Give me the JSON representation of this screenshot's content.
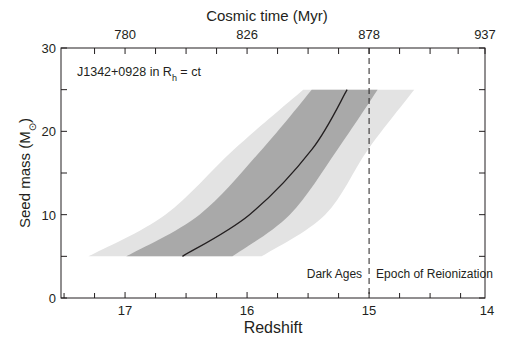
{
  "chart_data": {
    "type": "area",
    "title": "",
    "annotation": {
      "object": "J1342+0928 in R",
      "subscript": "h",
      "suffix": " = ct"
    },
    "xlabel": "Redshift",
    "ylabel": "Seed mass (M",
    "ylabel_sub": "⊙",
    "ylabel_end": ")",
    "x2label": "Cosmic time (Myr)",
    "xlim": [
      17.525,
      14.05
    ],
    "ylim": [
      0,
      30
    ],
    "grid": false,
    "x_ticks": [
      17,
      16,
      15,
      14
    ],
    "x_minor_step": 0.25,
    "y_ticks": [
      0,
      10,
      20,
      30
    ],
    "y_minor_step": 5,
    "x2_ticks": [
      {
        "label": "780",
        "z": 17
      },
      {
        "label": "826",
        "z": 16
      },
      {
        "label": "878",
        "z": 15
      },
      {
        "label": "937",
        "z": 14.05
      }
    ],
    "x2_minor": [
      17.25,
      16.75,
      16.5,
      16.25,
      15.75,
      15.5,
      15.25,
      14.75,
      14.5,
      14.27
    ],
    "reference_line": {
      "z": 15,
      "style": "dashed"
    },
    "region_labels": {
      "left": "Dark Ages",
      "right": "Epoch of Reionization"
    },
    "series": [
      {
        "name": "outer band",
        "color": "#e3e3e3",
        "lower_edge": [
          [
            17.3,
            5
          ],
          [
            16.67,
            10
          ],
          [
            16.11,
            17.8
          ],
          [
            15.54,
            25
          ]
        ],
        "upper_edge": [
          [
            15.88,
            5
          ],
          [
            15.36,
            10
          ],
          [
            15.01,
            17.8
          ],
          [
            14.63,
            25
          ]
        ]
      },
      {
        "name": "inner band",
        "color": "#a9a9a9",
        "lower_edge": [
          [
            16.99,
            5
          ],
          [
            16.39,
            10
          ],
          [
            15.88,
            17.8
          ],
          [
            15.47,
            25
          ]
        ],
        "upper_edge": [
          [
            16.12,
            5
          ],
          [
            15.65,
            10
          ],
          [
            15.26,
            17.8
          ],
          [
            14.93,
            25
          ]
        ]
      },
      {
        "name": "best-fit curve",
        "color": "#231f20",
        "points": [
          [
            16.53,
            5
          ],
          [
            15.98,
            10
          ],
          [
            15.47,
            17.8
          ],
          [
            15.18,
            25
          ]
        ]
      }
    ]
  }
}
